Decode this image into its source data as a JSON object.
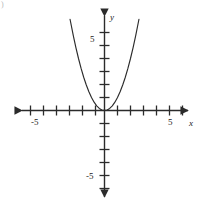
{
  "figure": {
    "corner_mark": ")",
    "background": "#ffffff",
    "stroke_color": "#2b2b2b"
  },
  "axes": {
    "x_name": "x",
    "y_name": "y",
    "x_labels": [
      {
        "value": -5,
        "text": "-5"
      },
      {
        "value": 5,
        "text": "5"
      }
    ],
    "y_labels": [
      {
        "value": 5,
        "text": "5"
      },
      {
        "value": -5,
        "text": "-5"
      }
    ]
  },
  "chart_data": {
    "type": "line",
    "title": "",
    "xlabel": "x",
    "ylabel": "y",
    "xlim": [
      -7.5,
      7.5
    ],
    "ylim": [
      -7,
      7
    ],
    "grid": false,
    "legend": null,
    "x_ticks": [
      -7,
      -6,
      -5,
      -4,
      -3,
      -2,
      -1,
      0,
      1,
      2,
      3,
      4,
      5,
      6,
      7
    ],
    "y_ticks": [
      -6,
      -5,
      -4,
      -3,
      -2,
      -1,
      0,
      1,
      2,
      3,
      4,
      5,
      6
    ],
    "x_tick_labels": [
      "",
      "",
      "-5",
      "",
      "",
      "",
      "",
      "",
      "",
      "",
      "",
      "",
      "5",
      "",
      ""
    ],
    "y_tick_labels": [
      "",
      "-5",
      "",
      "",
      "",
      "",
      "",
      "",
      "",
      "",
      "5",
      "",
      ""
    ],
    "series": [
      {
        "name": "y = x^2",
        "equation": "y = x^2",
        "x": [
          -2.65,
          -2.4,
          -2.2,
          -2.0,
          -1.8,
          -1.6,
          -1.4,
          -1.2,
          -1.0,
          -0.8,
          -0.6,
          -0.4,
          -0.2,
          0,
          0.2,
          0.4,
          0.6,
          0.8,
          1.0,
          1.2,
          1.4,
          1.6,
          1.8,
          2.0,
          2.2,
          2.4,
          2.65
        ],
        "values": [
          7.02,
          5.76,
          4.84,
          4.0,
          3.24,
          2.56,
          1.96,
          1.44,
          1.0,
          0.64,
          0.36,
          0.16,
          0.04,
          0,
          0.04,
          0.16,
          0.36,
          0.64,
          1.0,
          1.44,
          1.96,
          2.56,
          3.24,
          4.0,
          4.84,
          5.76,
          7.02
        ],
        "vertex": [
          0,
          0
        ]
      }
    ]
  }
}
